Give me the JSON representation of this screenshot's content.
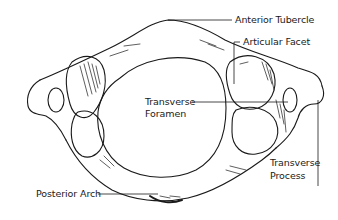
{
  "diagram": {
    "colors": {
      "ink": "#1a1a1a",
      "background": "#ffffff"
    },
    "labels": {
      "anterior_tubercle": "Anterior Tubercle",
      "articular_facet": "Articular Facet",
      "transverse_foramen_line1": "Transverse",
      "transverse_foramen_line2": "Foramen",
      "transverse_process_line1": "Transverse",
      "transverse_process_line2": "Process",
      "posterior_arch": "Posterior Arch"
    }
  }
}
